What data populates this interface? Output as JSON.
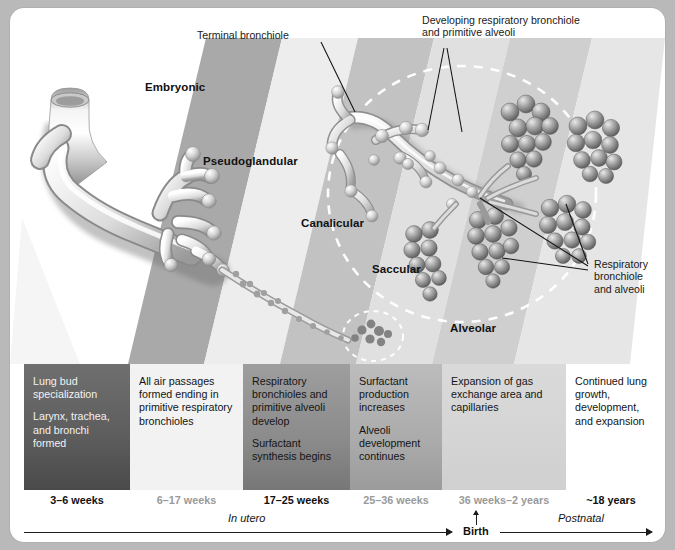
{
  "stage_bands": [
    {
      "name": "Embryonic",
      "x": 135,
      "y": 73
    },
    {
      "name": "Pseudoglandular",
      "x": 203,
      "y": 147
    },
    {
      "name": "Canalicular",
      "x": 297,
      "y": 215
    },
    {
      "name": "Saccular",
      "x": 370,
      "y": 259
    },
    {
      "name": "Alveolar",
      "x": 450,
      "y": 322
    }
  ],
  "callouts": [
    {
      "id": "terminal-bronchiole",
      "text": "Terminal bronchiole",
      "x": 194,
      "y": 26
    },
    {
      "id": "developing-respiratory-bronchiole",
      "text": "Developing respiratory bronchiole\nand primitive alveoli",
      "x": 419,
      "y": 10
    },
    {
      "id": "respiratory-bronchiole-and-alveoli",
      "text": "Respiratory\nbronchiole\nand alveoli",
      "x": 585,
      "y": 256
    }
  ],
  "table": {
    "columns": [
      {
        "stage": "Embryonic",
        "paragraphs": [
          "Lung bud\nspecialization",
          "Larynx, trachea,\nand bronchi\nformed"
        ],
        "weeks": "3–6 weeks",
        "weeks_style": "dark",
        "shade": "dark"
      },
      {
        "stage": "Pseudoglandular",
        "paragraphs": [
          "All air passages\nformed ending\nin primitive\nrespiratory\nbronchioles"
        ],
        "weeks": "6–17 weeks",
        "weeks_style": "light",
        "shade": "light"
      },
      {
        "stage": "Canalicular",
        "paragraphs": [
          "Respiratory\nbronchioles and\nprimitive alveoli\ndevelop",
          "Surfactant\nsynthesis begins"
        ],
        "weeks": "17–25 weeks",
        "weeks_style": "dark",
        "shade": "dark"
      },
      {
        "stage": "Saccular",
        "paragraphs": [
          "Surfactant\nproduction\nincreases",
          "Alveoli\ndevelopment\ncontinues"
        ],
        "weeks": "25–36 weeks",
        "weeks_style": "light",
        "shade": "mid"
      },
      {
        "stage": "Alveolar",
        "paragraphs": [
          "Expansion of gas\nexchange area\nand capillaries"
        ],
        "weeks": "36 weeks–2 years",
        "weeks_style": "light",
        "shade": "pale"
      },
      {
        "stage": "Postnatal growth",
        "paragraphs": [
          "Continued lung\ngrowth,\ndevelopment, and\nexpansion"
        ],
        "weeks": "~18 years",
        "weeks_style": "dark",
        "shade": "none"
      }
    ]
  },
  "timeline": {
    "in_utero_label": "In utero",
    "birth_label": "Birth",
    "postnatal_label": "Postnatal"
  },
  "colors": {
    "page_background": "#b9b9b9",
    "card_background": "#ffffff",
    "band_dark": "#a8a8a8",
    "band_light": "#e4e4e4",
    "text": "#141414",
    "muted_text": "#9a9a9a",
    "axis": "#1c1c1c"
  }
}
